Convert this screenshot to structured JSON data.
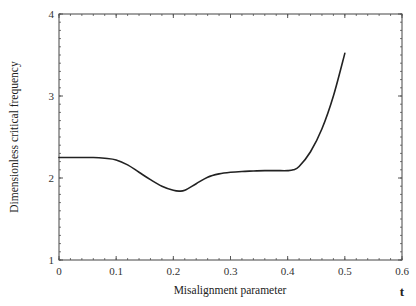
{
  "chart_data": {
    "type": "line",
    "title": "",
    "xlabel": "Misalignment parameter",
    "ylabel": "Dimensionless critical frequency",
    "x_symbol": "t",
    "xlim": [
      0,
      0.6
    ],
    "ylim": [
      1,
      4
    ],
    "xticks": [
      0,
      0.1,
      0.2,
      0.3,
      0.4,
      0.5,
      0.6
    ],
    "xtick_labels": [
      "0",
      "0.1",
      "0.2",
      "0.3",
      "0.4",
      "0.5",
      "0.6"
    ],
    "yticks": [
      1,
      2,
      3,
      4
    ],
    "ytick_labels": [
      "1",
      "2",
      "3",
      "4"
    ],
    "grid": false,
    "legend": null,
    "series": [
      {
        "name": "critical frequency",
        "color": "#222222",
        "x": [
          0,
          0.02,
          0.04,
          0.06,
          0.08,
          0.1,
          0.12,
          0.14,
          0.16,
          0.18,
          0.2,
          0.21,
          0.22,
          0.24,
          0.26,
          0.28,
          0.3,
          0.32,
          0.34,
          0.36,
          0.38,
          0.4,
          0.41,
          0.42,
          0.44,
          0.46,
          0.48,
          0.5
        ],
        "y": [
          2.25,
          2.25,
          2.25,
          2.25,
          2.24,
          2.22,
          2.16,
          2.07,
          1.98,
          1.9,
          1.85,
          1.84,
          1.85,
          1.93,
          2.01,
          2.05,
          2.07,
          2.08,
          2.085,
          2.09,
          2.09,
          2.09,
          2.1,
          2.14,
          2.32,
          2.6,
          3.0,
          3.52
        ]
      }
    ]
  },
  "plot_frame": {
    "left": 59,
    "top": 14,
    "right": 402,
    "bottom": 260
  }
}
